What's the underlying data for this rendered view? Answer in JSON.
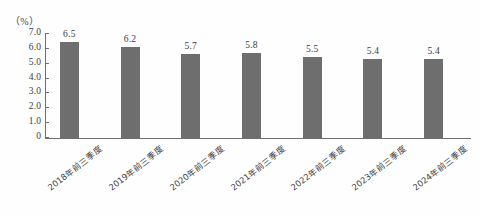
{
  "chart_data": {
    "type": "bar",
    "title": "",
    "subtitle": "",
    "xlabel": "",
    "ylabel": "",
    "unit_label": "（%）",
    "categories": [
      "2018年前三季度",
      "2019年前三季度",
      "2020年前三季度",
      "2021年前三季度",
      "2022年前三季度",
      "2023年前三季度",
      "2024年前三季度"
    ],
    "values": [
      6.5,
      6.2,
      5.7,
      5.8,
      5.5,
      5.4,
      5.4
    ],
    "data_labels": [
      "6.5",
      "6.2",
      "5.7",
      "5.8",
      "5.5",
      "5.4",
      "5.4"
    ],
    "ylim": [
      0,
      7
    ],
    "ytick_values": [
      7,
      6,
      5,
      4,
      3,
      2,
      1,
      0
    ],
    "ytick_labels": [
      "7.0",
      "6.0",
      "5.0",
      "4.0",
      "3.0",
      "2.0",
      "1.0",
      "0"
    ],
    "grid": false,
    "legend": null,
    "legend_position": "none",
    "bar_color": "#6e6e6e",
    "axis_color": "#6f6f6f",
    "background_color": "#fefefe",
    "text_color": "#3a3a3a"
  }
}
